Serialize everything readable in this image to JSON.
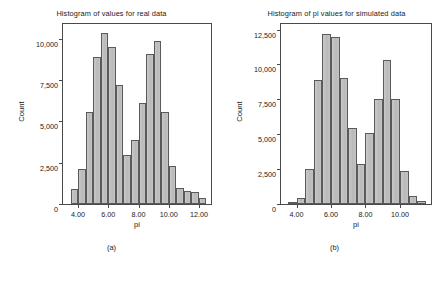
{
  "figure": {
    "panels": [
      {
        "id": "a",
        "caption": "(a)",
        "title": "Histogram of values for real data",
        "xlabel": "pi",
        "ylabel": "Count"
      },
      {
        "id": "b",
        "caption": "(b)",
        "title": "Histogram of pi values for simulated data",
        "xlabel": "pi",
        "ylabel": "Count"
      }
    ]
  },
  "chart_data": [
    {
      "type": "bar",
      "panel": "a",
      "title": "Histogram of values for real data",
      "xlabel": "pi",
      "ylabel": "Count",
      "xlim": [
        3.0,
        12.8
      ],
      "ylim": [
        0,
        10900
      ],
      "grid": false,
      "legend": null,
      "xticks": [
        4.0,
        6.0,
        8.0,
        10.0,
        12.0
      ],
      "xtick_labels": [
        "4.00",
        "6.00",
        "8.00",
        "10.00",
        "12.00"
      ],
      "yticks": [
        0,
        2500,
        5000,
        7500,
        10000
      ],
      "ytick_labels": [
        "0",
        "2,500",
        "5,000",
        "7,500",
        "10,000"
      ],
      "bin_width": 0.5,
      "bin_starts": [
        3.5,
        4.0,
        4.5,
        5.0,
        5.5,
        6.0,
        6.5,
        7.0,
        7.5,
        8.0,
        8.5,
        9.0,
        9.5,
        10.0,
        10.5,
        11.0,
        11.5,
        12.0
      ],
      "bin_centers": [
        3.75,
        4.25,
        4.75,
        5.25,
        5.75,
        6.25,
        6.75,
        7.25,
        7.75,
        8.25,
        8.75,
        9.25,
        9.75,
        10.25,
        10.75,
        11.25,
        11.75,
        12.25
      ],
      "values": [
        900,
        2150,
        5550,
        8900,
        10350,
        9500,
        7200,
        2950,
        3900,
        6100,
        9100,
        9900,
        5600,
        2300,
        950,
        800,
        700,
        380
      ]
    },
    {
      "type": "bar",
      "panel": "b",
      "title": "Histogram of pi values for simulated data",
      "xlabel": "pi",
      "ylabel": "Count",
      "xlim": [
        3.1,
        11.8
      ],
      "ylim": [
        0,
        12900
      ],
      "grid": false,
      "legend": null,
      "xticks": [
        4.0,
        6.0,
        8.0,
        10.0
      ],
      "xtick_labels": [
        "4.00",
        "6.00",
        "8.00",
        "10.00"
      ],
      "yticks": [
        0,
        2500,
        5000,
        7500,
        10000,
        12500
      ],
      "ytick_labels": [
        "0",
        "2,500",
        "5,000",
        "7,500",
        "10,000",
        "12,500"
      ],
      "bin_width": 0.5,
      "bin_starts": [
        3.5,
        4.0,
        4.5,
        5.0,
        5.5,
        6.0,
        6.5,
        7.0,
        7.5,
        8.0,
        8.5,
        9.0,
        9.5,
        10.0,
        10.5,
        11.0
      ],
      "bin_centers": [
        3.75,
        4.25,
        4.75,
        5.25,
        5.75,
        6.25,
        6.75,
        7.25,
        7.75,
        8.25,
        8.75,
        9.25,
        9.75,
        10.25,
        10.75,
        11.25
      ],
      "values": [
        120,
        400,
        2480,
        8900,
        12150,
        12000,
        9050,
        5450,
        2900,
        5120,
        7550,
        10300,
        7500,
        2400,
        600,
        200
      ]
    }
  ]
}
